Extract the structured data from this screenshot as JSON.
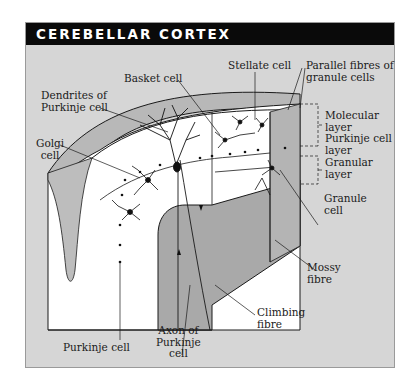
{
  "title": "CEREBELLAR CORTEX",
  "colors": {
    "frame_bg": "#d6d6d6",
    "title_bg": "#0a0a0a",
    "title_text": "#ffffff",
    "tissue_white": "#ffffff",
    "white_matter_grey": "#a9a9a9",
    "line": "#1a1a1a"
  },
  "labels": {
    "basket_cell": "Basket cell",
    "stellate_cell": "Stellate cell",
    "parallel_fibres": [
      "Parallel fibres of",
      "granule cells"
    ],
    "dendrites_purkinje": [
      "Dendrites of",
      "Purkinje cell"
    ],
    "golgi_cell": [
      "Golgi",
      "cell"
    ],
    "molecular_layer": [
      "Molecular",
      "layer"
    ],
    "purkinje_cell_layer": [
      "Purkinje cell",
      "layer"
    ],
    "granular_layer": [
      "Granular",
      "layer"
    ],
    "granule_cell": [
      "Granule",
      "cell"
    ],
    "mossy_fibre": [
      "Mossy",
      "fibre"
    ],
    "climbing_fibre": [
      "Climbing",
      "fibre"
    ],
    "axon_purkinje": [
      "Axon of",
      "Purkinje",
      "cell"
    ],
    "purkinje_cell": "Purkinje cell"
  }
}
